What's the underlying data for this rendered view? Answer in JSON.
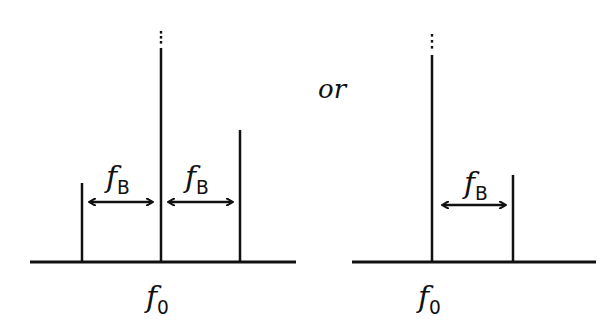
{
  "figure": {
    "connector_text": "or",
    "left_panel": {
      "center_label": {
        "symbol": "f",
        "subscript": "0"
      },
      "spacing_labels": [
        {
          "symbol": "f",
          "subscript": "B"
        },
        {
          "symbol": "f",
          "subscript": "B"
        }
      ],
      "spikes": [
        {
          "name": "lower-sideband",
          "x": 82,
          "top": 183
        },
        {
          "name": "carrier",
          "x": 161,
          "top": 48,
          "continues_upward": true
        },
        {
          "name": "upper-sideband",
          "x": 240,
          "top": 130
        }
      ],
      "baseline": {
        "y": 262,
        "x1": 30,
        "x2": 296
      },
      "arrows": [
        {
          "x1": 88,
          "x2": 154,
          "y": 202
        },
        {
          "x1": 167,
          "x2": 234,
          "y": 202
        }
      ]
    },
    "right_panel": {
      "center_label": {
        "symbol": "f",
        "subscript": "0"
      },
      "spacing_labels": [
        {
          "symbol": "f",
          "subscript": "B"
        }
      ],
      "spikes": [
        {
          "name": "carrier",
          "x": 432,
          "top": 55,
          "continues_upward": true
        },
        {
          "name": "sideband",
          "x": 513,
          "top": 175
        }
      ],
      "baseline": {
        "y": 262,
        "x1": 352,
        "x2": 596
      },
      "arrows": [
        {
          "x1": 441,
          "x2": 507,
          "y": 205
        }
      ]
    },
    "colors": {
      "ink": "#111111",
      "background": "#ffffff"
    }
  }
}
